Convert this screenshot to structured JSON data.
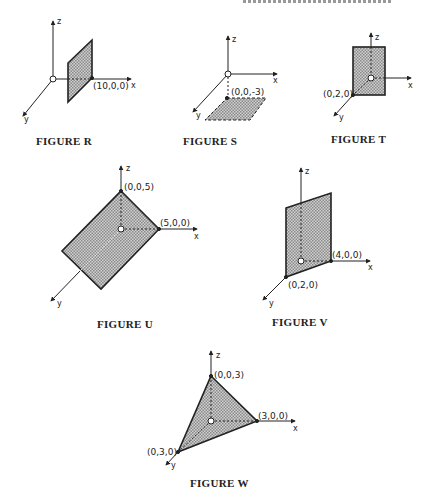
{
  "figures": [
    {
      "id": "R",
      "caption": "FIGURE R",
      "points": [
        {
          "label": "(10,0,0)"
        }
      ],
      "axes": {
        "x": "x",
        "y": "y",
        "z": "z"
      }
    },
    {
      "id": "S",
      "caption": "FIGURE S",
      "points": [
        {
          "label": "(0,0,-3)"
        }
      ],
      "axes": {
        "x": "x",
        "y": "y",
        "z": "z"
      }
    },
    {
      "id": "T",
      "caption": "FIGURE T",
      "points": [
        {
          "label": "(0,2,0)"
        }
      ],
      "axes": {
        "x": "x",
        "y": "y",
        "z": "z"
      }
    },
    {
      "id": "U",
      "caption": "FIGURE U",
      "points": [
        {
          "label": "(0,0,5)"
        },
        {
          "label": "(5,0,0)"
        }
      ],
      "axes": {
        "x": "x",
        "y": "y",
        "z": "z"
      }
    },
    {
      "id": "V",
      "caption": "FIGURE V",
      "points": [
        {
          "label": "(4,0,0)"
        },
        {
          "label": "(0,2,0)"
        }
      ],
      "axes": {
        "x": "x",
        "y": "y",
        "z": "z"
      }
    },
    {
      "id": "W",
      "caption": "FIGURE W",
      "points": [
        {
          "label": "(0,0,3)"
        },
        {
          "label": "(3,0,0)"
        },
        {
          "label": "(0,3,0)"
        }
      ],
      "axes": {
        "x": "x",
        "y": "y",
        "z": "z"
      }
    }
  ],
  "colors": {
    "ink": "#222222",
    "fill": "#b8b8b8"
  }
}
